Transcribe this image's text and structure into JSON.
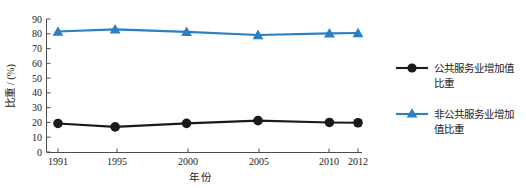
{
  "chart_data": {
    "type": "line",
    "title": "",
    "subtitle": "",
    "xlabel": "年 份",
    "ylabel": "比重 / (%)",
    "x": [
      "1991",
      "1995",
      "2000",
      "2005",
      "2010",
      "2012"
    ],
    "categories": [
      "1991",
      "1995",
      "2000",
      "2005",
      "2010",
      "2012"
    ],
    "xlim": [
      1991,
      2012
    ],
    "ylim": [
      0,
      90
    ],
    "yticks": [
      0,
      10,
      20,
      30,
      40,
      50,
      60,
      70,
      80,
      90
    ],
    "ytick_labels": [
      "0",
      "10",
      "20",
      "30",
      "40",
      "50",
      "60",
      "70",
      "80",
      "90"
    ],
    "xtick_labels": [
      "1991",
      "1995",
      "2000",
      "2005",
      "2010",
      "2012"
    ],
    "grid": false,
    "legend_position": "right",
    "series": [
      {
        "name": "公共服务业增加值比重",
        "marker": "circle",
        "color": "#1a1a1a",
        "values": [
          19.3,
          17.0,
          19.4,
          21.2,
          20.0,
          19.8
        ]
      },
      {
        "name": "非公共服务业增加值比重",
        "marker": "triangle",
        "color": "#2b7fc4",
        "values": [
          81.5,
          83.0,
          81.3,
          79.2,
          80.3,
          80.5
        ]
      }
    ]
  },
  "axes": {
    "y_axis_title": "比重 / (%)",
    "x_axis_title": "年 份",
    "y_tick_labels": [
      "90",
      "80",
      "70",
      "60",
      "50",
      "40",
      "30",
      "20",
      "10",
      "0"
    ],
    "x_tick_labels": [
      "1991",
      "1995",
      "2000",
      "2005",
      "2010",
      "2012"
    ]
  },
  "legend": {
    "entries": [
      {
        "label": "公共服务业增加值比重",
        "label_line1": "公共服务业增加值",
        "label_line2": "比重",
        "marker": "circle-marker-icon",
        "color": "#1a1a1a"
      },
      {
        "label": "非公共服务业增加值比重",
        "label_line1": "非公共服务业增加",
        "label_line2": "值比重",
        "marker": "triangle-marker-icon",
        "color": "#2b7fc4"
      }
    ]
  },
  "colors": {
    "series_public": "#1a1a1a",
    "series_nonpublic": "#2b7fc4",
    "axis": "#4d4d4d",
    "background": "#ffffff"
  }
}
